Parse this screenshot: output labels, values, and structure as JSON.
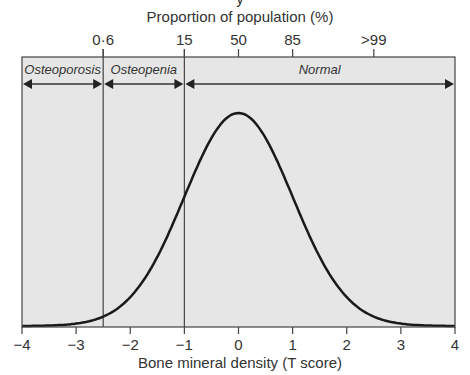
{
  "chart_data": {
    "type": "line",
    "title": "",
    "top_partial_text": "y",
    "xlabel": "Bone mineral density (T score)",
    "top_axis_label": "Proportion of population (%)",
    "ylabel": "",
    "xlim": [
      -4,
      4
    ],
    "x_ticks": [
      -4,
      -3,
      -2,
      -1,
      0,
      1,
      2,
      3,
      4
    ],
    "x_tick_labels": [
      "−4",
      "−3",
      "−2",
      "−1",
      "0",
      "1",
      "2",
      "3",
      "4"
    ],
    "top_ticks": [
      {
        "x": -2.5,
        "label": "0·6"
      },
      {
        "x": -1,
        "label": "15"
      },
      {
        "x": 0,
        "label": "50"
      },
      {
        "x": 1,
        "label": "85"
      },
      {
        "x": 2.5,
        "label": ">99"
      }
    ],
    "series": [
      {
        "name": "Normal distribution of T score",
        "distribution": "normal",
        "mean": 0,
        "sd": 1
      }
    ],
    "thresholds": [
      -2.5,
      -1
    ],
    "regions": [
      {
        "label": "Osteoporosis",
        "from": -4,
        "to": -2.5
      },
      {
        "label": "Osteopenia",
        "from": -2.5,
        "to": -1
      },
      {
        "label": "Normal",
        "from": -1,
        "to": 4
      }
    ],
    "grid": false,
    "colors": {
      "background": "#e6e6e6",
      "line": "#1a1a1a",
      "frame": "#444444"
    }
  }
}
